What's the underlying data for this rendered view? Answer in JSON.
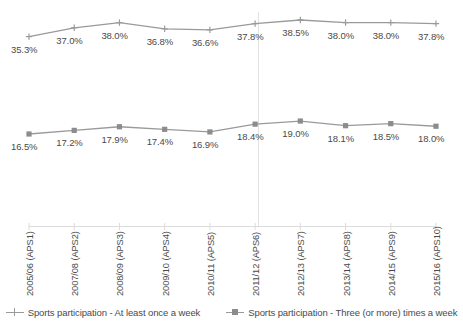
{
  "chart_data": {
    "type": "line",
    "title": "",
    "xlabel": "",
    "ylabel": "",
    "grid": false,
    "legend_position": "bottom",
    "categories": [
      "2005/06 (APS1)",
      "2007/08 (APS2)",
      "2008/09 (APS3)",
      "2009/10 (APS4)",
      "2010/11 (APS5)",
      "2011/12 (APS6)",
      "2012/13 (APS7)",
      "2013/14 (APS8)",
      "2014/15 (APS9)",
      "2015/16 (APS10)"
    ],
    "series": [
      {
        "name": "Sports participation - At least once a week",
        "marker": "plus",
        "color": "#9a9a9a",
        "values": [
          35.3,
          37.0,
          38.0,
          36.8,
          36.6,
          37.8,
          38.5,
          38.0,
          38.0,
          37.8
        ],
        "labels": [
          "35.3%",
          "37.0%",
          "38.0%",
          "36.8%",
          "36.6%",
          "37.8%",
          "38.5%",
          "38.0%",
          "38.0%",
          "37.8%"
        ]
      },
      {
        "name": "Sports participation - Three (or more) times a week",
        "marker": "square",
        "color": "#8c8c8c",
        "values": [
          16.5,
          17.2,
          17.9,
          17.4,
          16.9,
          18.4,
          19.0,
          18.1,
          18.5,
          18.0
        ],
        "labels": [
          "16.5%",
          "17.2%",
          "17.9%",
          "17.4%",
          "16.9%",
          "18.4%",
          "19.0%",
          "18.1%",
          "18.5%",
          "18.0%"
        ]
      }
    ],
    "ylim": [
      0,
      45
    ],
    "annotations": [
      {
        "type": "vertical-line",
        "at_category": "2011/12 (APS6)"
      }
    ]
  },
  "legend": {
    "entries": [
      {
        "label": "Sports participation - At least once a week"
      },
      {
        "label": "Sports participation - Three (or more) times a week"
      }
    ]
  }
}
